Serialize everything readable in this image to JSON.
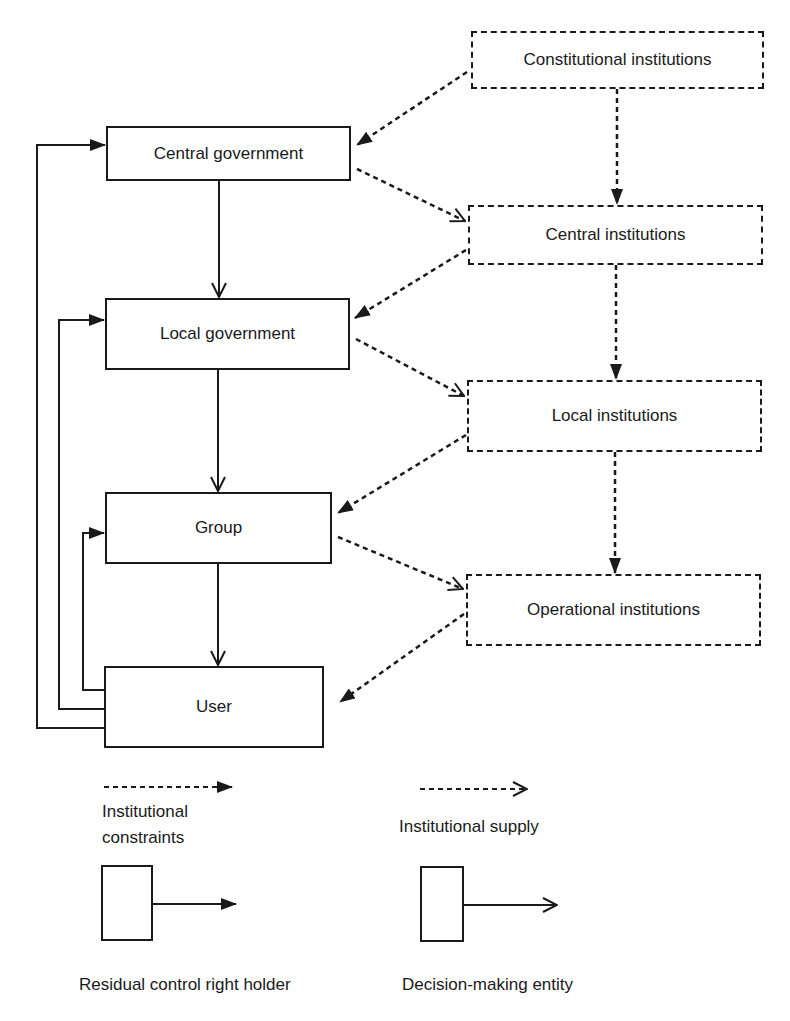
{
  "diagram": {
    "colors": {
      "stroke": "#1a1a1a",
      "background": "#ffffff"
    },
    "entities": [
      {
        "id": "central_gov",
        "label": "Central government",
        "x": 106,
        "y": 126,
        "w": 245,
        "h": 55
      },
      {
        "id": "local_gov",
        "label": "Local government",
        "x": 105,
        "y": 298,
        "w": 245,
        "h": 72
      },
      {
        "id": "group",
        "label": "Group",
        "x": 105,
        "y": 492,
        "w": 227,
        "h": 72
      },
      {
        "id": "user",
        "label": "User",
        "x": 104,
        "y": 666,
        "w": 220,
        "h": 82
      }
    ],
    "institutions": [
      {
        "id": "constitutional",
        "label": "Constitutional institutions",
        "x": 471,
        "y": 31,
        "w": 293,
        "h": 58
      },
      {
        "id": "central_inst",
        "label": "Central institutions",
        "x": 468,
        "y": 205,
        "w": 295,
        "h": 60
      },
      {
        "id": "local_inst",
        "label": "Local institutions",
        "x": 467,
        "y": 380,
        "w": 295,
        "h": 72
      },
      {
        "id": "operational",
        "label": "Operational institutions",
        "x": 466,
        "y": 574,
        "w": 295,
        "h": 72
      }
    ],
    "solid_down_arrows": [
      {
        "from": "central_gov",
        "to": "local_gov",
        "x": 219,
        "y1": 181,
        "y2": 297
      },
      {
        "from": "local_gov",
        "to": "group",
        "x": 218,
        "y1": 370,
        "y2": 491
      },
      {
        "from": "group",
        "to": "user",
        "x": 218,
        "y1": 564,
        "y2": 665
      }
    ],
    "feedback_arrows": [
      {
        "from": "user",
        "to": "central_gov",
        "xl": 37,
        "y_from": 728,
        "y_to": 145,
        "x_end": 105
      },
      {
        "from": "user",
        "to": "local_gov",
        "xl": 59,
        "y_from": 709,
        "y_to": 320,
        "x_end": 104
      },
      {
        "from": "user",
        "to": "group",
        "xl": 83,
        "y_from": 690,
        "y_to": 533,
        "x_end": 104
      }
    ],
    "dashed_down_arrows": [
      {
        "from": "constitutional",
        "to": "central_inst",
        "x": 617,
        "y1": 89,
        "y2": 204
      },
      {
        "from": "central_inst",
        "to": "local_inst",
        "x": 616,
        "y1": 265,
        "y2": 379
      },
      {
        "from": "local_inst",
        "to": "operational",
        "x": 615,
        "y1": 452,
        "y2": 573
      }
    ],
    "constraint_arrows": [
      {
        "from": "constitutional",
        "to": "central_gov",
        "x1": 467,
        "y1": 72,
        "x2": 357,
        "y2": 145
      },
      {
        "from": "central_inst",
        "to": "local_gov",
        "x1": 466,
        "y1": 250,
        "x2": 355,
        "y2": 318
      },
      {
        "from": "local_inst",
        "to": "group",
        "x1": 466,
        "y1": 435,
        "x2": 338,
        "y2": 513
      },
      {
        "from": "operational",
        "to": "user",
        "x1": 464,
        "y1": 614,
        "x2": 340,
        "y2": 702
      }
    ],
    "supply_arrows": [
      {
        "from": "central_gov",
        "to": "central_inst",
        "x1": 357,
        "y1": 169,
        "x2": 465,
        "y2": 221
      },
      {
        "from": "local_gov",
        "to": "local_inst",
        "x1": 356,
        "y1": 339,
        "x2": 464,
        "y2": 396
      },
      {
        "from": "group",
        "to": "operational",
        "x1": 338,
        "y1": 537,
        "x2": 463,
        "y2": 589
      }
    ]
  },
  "legend": {
    "constraints": {
      "label_line1": "Institutional",
      "label_line2": "constraints"
    },
    "supply": {
      "label": "Institutional supply"
    },
    "residual": {
      "label": "Residual control right holder"
    },
    "decision": {
      "label": "Decision-making entity"
    }
  }
}
